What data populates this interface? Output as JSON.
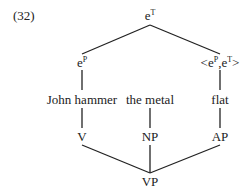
{
  "example_number": "(32)",
  "semantic_tree": {
    "root": {
      "base": "e",
      "sup": "T"
    },
    "left": {
      "base": "e",
      "sup": "P"
    },
    "right": {
      "open": "<",
      "b1": "e",
      "s1": "P",
      "comma": ",",
      "b2": "e",
      "s2": "T",
      "close": ">"
    }
  },
  "words": {
    "w1": "John hammer",
    "w2": "the metal",
    "w3": "flat"
  },
  "syntactic_tree": {
    "c1": "V",
    "c2": "NP",
    "c3": "AP",
    "root": "VP"
  },
  "colors": {
    "line": "#222222",
    "text": "#222222",
    "background": "#ffffff"
  }
}
